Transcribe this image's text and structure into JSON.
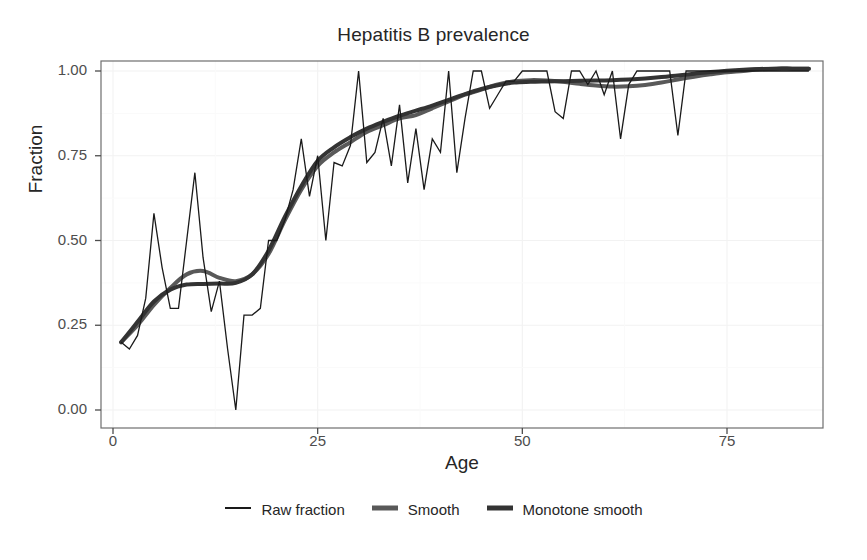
{
  "chart_data": {
    "type": "line",
    "title": "Hepatitis B prevalence",
    "xlabel": "Age",
    "ylabel": "Fraction",
    "xlim": [
      0,
      86
    ],
    "ylim": [
      0.0,
      1.06
    ],
    "xticks": [
      0,
      25,
      50,
      75
    ],
    "xtick_labels": [
      "0",
      "25",
      "50",
      "75"
    ],
    "yticks": [
      0.0,
      0.25,
      0.5,
      0.75,
      1.0
    ],
    "ytick_labels": [
      "0.00",
      "0.25",
      "0.50",
      "0.75",
      "1.00"
    ],
    "grid": true,
    "legend_position": "bottom",
    "series": [
      {
        "name": "Raw fraction",
        "color": "#1a1a1a",
        "width": 1.3,
        "x": [
          1,
          2,
          3,
          4,
          5,
          6,
          7,
          8,
          9,
          10,
          11,
          12,
          13,
          14,
          15,
          16,
          17,
          18,
          19,
          20,
          21,
          22,
          23,
          24,
          25,
          26,
          27,
          28,
          29,
          30,
          31,
          32,
          33,
          34,
          35,
          36,
          37,
          38,
          39,
          40,
          41,
          42,
          43,
          44,
          45,
          46,
          47,
          48,
          49,
          50,
          51,
          52,
          53,
          54,
          55,
          56,
          57,
          58,
          59,
          60,
          61,
          62,
          63,
          64,
          65,
          66,
          67,
          68,
          69,
          70,
          71,
          72,
          73,
          74,
          75,
          76,
          77,
          78,
          79,
          80,
          81,
          82,
          83,
          84,
          85
        ],
        "y": [
          0.2,
          0.18,
          0.22,
          0.33,
          0.58,
          0.42,
          0.3,
          0.3,
          0.5,
          0.7,
          0.45,
          0.29,
          0.38,
          0.18,
          0.0,
          0.28,
          0.28,
          0.3,
          0.5,
          0.5,
          0.56,
          0.65,
          0.8,
          0.63,
          0.75,
          0.5,
          0.73,
          0.72,
          0.78,
          1.0,
          0.73,
          0.76,
          0.86,
          0.72,
          0.9,
          0.67,
          0.83,
          0.65,
          0.8,
          0.76,
          1.0,
          0.7,
          0.86,
          1.0,
          1.0,
          0.89,
          0.93,
          0.97,
          0.97,
          1.0,
          1.0,
          1.0,
          1.0,
          0.88,
          0.86,
          1.0,
          1.0,
          0.96,
          1.0,
          0.93,
          1.0,
          0.8,
          0.96,
          1.0,
          1.0,
          1.0,
          1.0,
          1.0,
          0.81,
          1.0,
          1.0,
          1.0,
          1.0,
          1.0,
          1.0,
          1.0,
          1.0,
          1.0,
          1.0,
          1.0,
          1.0,
          1.0,
          1.0,
          1.0,
          1.0
        ]
      },
      {
        "name": "Smooth",
        "color": "#595959",
        "width": 4.0,
        "x": [
          1,
          3,
          5,
          7,
          9,
          11,
          13,
          15,
          17,
          19,
          21,
          23,
          25,
          27,
          29,
          31,
          33,
          35,
          37,
          39,
          41,
          43,
          45,
          47,
          49,
          51,
          53,
          55,
          57,
          59,
          61,
          63,
          65,
          67,
          69,
          71,
          73,
          75,
          77,
          79,
          81,
          83,
          85
        ],
        "y": [
          0.2,
          0.25,
          0.31,
          0.36,
          0.4,
          0.41,
          0.39,
          0.38,
          0.4,
          0.46,
          0.56,
          0.65,
          0.72,
          0.76,
          0.79,
          0.82,
          0.84,
          0.86,
          0.87,
          0.89,
          0.91,
          0.93,
          0.945,
          0.96,
          0.97,
          0.973,
          0.972,
          0.968,
          0.962,
          0.957,
          0.954,
          0.955,
          0.959,
          0.966,
          0.975,
          0.983,
          0.99,
          0.996,
          1.0,
          1.005,
          1.007,
          1.007,
          1.007
        ]
      },
      {
        "name": "Monotone smooth",
        "color": "#333333",
        "width": 4.0,
        "x": [
          1,
          3,
          5,
          7,
          9,
          11,
          13,
          15,
          17,
          19,
          21,
          23,
          25,
          27,
          29,
          31,
          33,
          35,
          37,
          39,
          41,
          43,
          45,
          47,
          49,
          51,
          53,
          55,
          57,
          59,
          61,
          63,
          65,
          67,
          69,
          71,
          73,
          75,
          77,
          79,
          81,
          83,
          85
        ],
        "y": [
          0.2,
          0.26,
          0.32,
          0.355,
          0.37,
          0.372,
          0.373,
          0.375,
          0.4,
          0.47,
          0.57,
          0.66,
          0.735,
          0.775,
          0.805,
          0.83,
          0.85,
          0.868,
          0.883,
          0.898,
          0.915,
          0.932,
          0.947,
          0.958,
          0.966,
          0.968,
          0.969,
          0.97,
          0.971,
          0.972,
          0.973,
          0.975,
          0.978,
          0.982,
          0.987,
          0.992,
          0.997,
          1.001,
          1.004,
          1.006,
          1.007,
          1.007,
          1.007
        ]
      }
    ]
  },
  "legend": {
    "items": [
      {
        "label": "Raw fraction",
        "color": "#1a1a1a",
        "width": 2
      },
      {
        "label": "Smooth",
        "color": "#595959",
        "width": 5
      },
      {
        "label": "Monotone smooth",
        "color": "#333333",
        "width": 5
      }
    ]
  },
  "panel": {
    "background": "#ffffff",
    "border_color": "#6e6e6e",
    "grid_color": "#f2f2f2"
  }
}
